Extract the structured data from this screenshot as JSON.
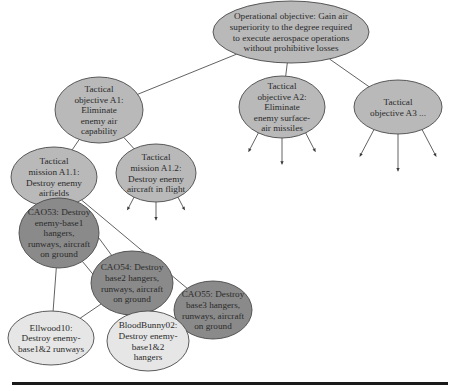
{
  "diagram": {
    "type": "hierarchy",
    "colors": {
      "light_fill": "#e6e6e6",
      "medium_fill": "#b9b9b9",
      "dark_fill": "#8a8a8a",
      "line": "#3a3a3a"
    },
    "nodes": [
      {
        "id": "operational-objective",
        "shade": "medium",
        "lines": [
          "Operational objective: Gain air",
          "superiority to the degree required",
          "to execute aerospace operations",
          "without prohibitive losses"
        ]
      },
      {
        "id": "tactical-objective-a1",
        "shade": "medium",
        "lines": [
          "Tactical",
          "objective A1:",
          "Eliminate",
          "enemy air",
          "capability"
        ]
      },
      {
        "id": "tactical-objective-a2",
        "shade": "medium",
        "lines": [
          "Tactical",
          "objective A2:",
          "Eliminate",
          "enemy surface-",
          "air missiles"
        ]
      },
      {
        "id": "tactical-objective-a3",
        "shade": "medium",
        "lines": [
          "Tactical",
          "objective A3 ..."
        ]
      },
      {
        "id": "tactical-mission-a1-1",
        "shade": "medium",
        "lines": [
          "Tactical",
          "mission A1.1:",
          "Destroy enemy",
          "airfields"
        ]
      },
      {
        "id": "tactical-mission-a1-2",
        "shade": "medium",
        "lines": [
          "Tactical",
          "mission A1.2:",
          "Destroy enemy",
          "aircraft in flight"
        ]
      },
      {
        "id": "cao53",
        "shade": "dark",
        "lines": [
          "CAO53: Destroy",
          "enemy-base1",
          "hangers,",
          "runways, aircraft",
          "on ground"
        ]
      },
      {
        "id": "cao54",
        "shade": "dark",
        "lines": [
          "CAO54: Destroy",
          "base2 hangers,",
          "runways, aircraft",
          "on ground"
        ]
      },
      {
        "id": "cao55",
        "shade": "dark",
        "lines": [
          "CAO55: Destroy",
          "base3 hangers,",
          "runways, aircraft",
          "on ground"
        ]
      },
      {
        "id": "ellwood10",
        "shade": "light",
        "lines": [
          "Ellwood10:",
          "Destroy enemy-",
          "base1&2 runways"
        ]
      },
      {
        "id": "bloodbunny02",
        "shade": "light",
        "lines": [
          "BloodBunny02:",
          "Destroy enemy-",
          "base1&2",
          "hangers"
        ]
      }
    ],
    "edges": [
      [
        "operational-objective",
        "tactical-objective-a1"
      ],
      [
        "operational-objective",
        "tactical-objective-a2"
      ],
      [
        "operational-objective",
        "tactical-objective-a3"
      ],
      [
        "tactical-objective-a1",
        "tactical-mission-a1-1"
      ],
      [
        "tactical-objective-a1",
        "tactical-mission-a1-2"
      ],
      [
        "tactical-mission-a1-1",
        "cao53"
      ],
      [
        "tactical-mission-a1-1",
        "cao54"
      ],
      [
        "tactical-mission-a1-1",
        "cao55"
      ],
      [
        "cao53",
        "ellwood10"
      ],
      [
        "cao53",
        "bloodbunny02"
      ],
      [
        "cao54",
        "ellwood10"
      ],
      [
        "cao54",
        "bloodbunny02"
      ]
    ],
    "open_branches": [
      {
        "node": "tactical-mission-a1-2",
        "count": 3
      },
      {
        "node": "tactical-objective-a2",
        "count": 3
      },
      {
        "node": "tactical-objective-a3",
        "count": 3
      }
    ]
  }
}
